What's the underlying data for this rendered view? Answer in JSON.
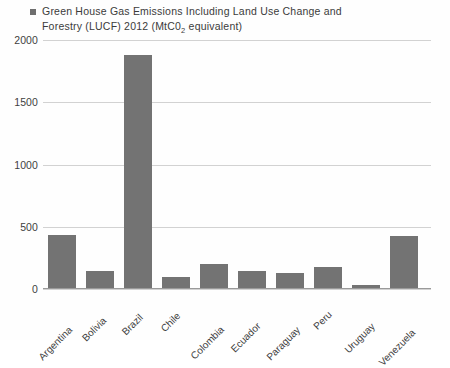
{
  "legend": {
    "marker_color": "#6e6e6e",
    "text_part1": "Green House Gas Emissions Including Land Use Change and Forestry (LUCF) 2012 (MtC0",
    "text_sub": "2",
    "text_part2": " equivalent)",
    "full_text": "Green House Gas Emissions Including Land Use Change and Forestry (LUCF) 2012 (MtC02 equivalent)"
  },
  "colors": {
    "bar": "#737373",
    "gridline": "#d2d2d2",
    "axis": "#9a9a9a",
    "text": "#3f3f3f",
    "background": "#fefefe"
  },
  "chart_data": {
    "type": "bar",
    "title": "",
    "subtitle": "",
    "xlabel": "",
    "ylabel": "",
    "legend_entries": [
      "Green House Gas Emissions Including Land Use Change and Forestry (LUCF) 2012 (MtC02 equivalent)"
    ],
    "legend_position": "top-left",
    "grid": true,
    "grid_axis": "y",
    "ylim": [
      0,
      2000
    ],
    "yticks": [
      0,
      500,
      1000,
      1500,
      2000
    ],
    "ytick_labels": [
      "0",
      "500",
      "1000",
      "1500",
      "2000"
    ],
    "xtick_rotation": -45,
    "categories": [
      "Argentina",
      "Bolivia",
      "Brazil",
      "Chile",
      "Colombia",
      "Ecuador",
      "Paraguay",
      "Peru",
      "Uruguay",
      "Venezuela"
    ],
    "values": [
      425,
      137,
      1870,
      88,
      193,
      140,
      120,
      165,
      25,
      415
    ],
    "units": "MtCO2 equivalent",
    "series": [
      {
        "name": "Green House Gas Emissions Including Land Use Change and Forestry (LUCF) 2012 (MtC02 equivalent)",
        "values": [
          425,
          137,
          1870,
          88,
          193,
          140,
          120,
          165,
          25,
          415
        ]
      }
    ]
  }
}
